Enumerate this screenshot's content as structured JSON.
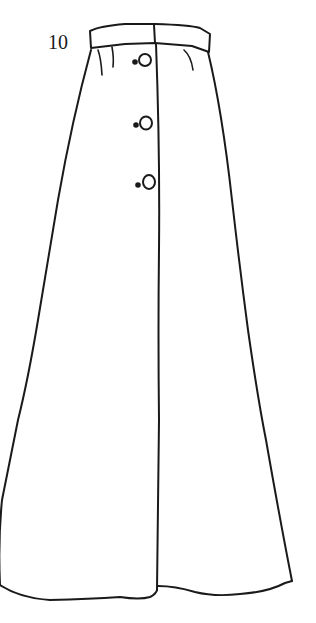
{
  "figure": {
    "label": "10",
    "button_count": 3,
    "line_color": "#1a1a1a",
    "background_color": "#ffffff"
  }
}
